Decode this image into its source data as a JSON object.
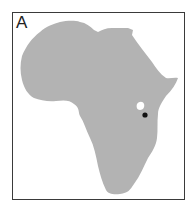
{
  "panel": {
    "label": "A"
  },
  "map": {
    "region": "Africa",
    "land_color": "#b3b3b3",
    "water_color": "#ffffff",
    "lake_label": "Lake Victoria",
    "marker": {
      "color": "#111111",
      "x": 145,
      "y": 115
    }
  }
}
